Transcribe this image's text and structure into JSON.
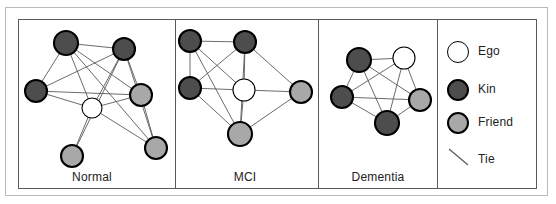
{
  "figure": {
    "type": "network-diagram-panels",
    "caption_labels": [
      "Normal",
      "MCI",
      "Dementia"
    ]
  },
  "colors": {
    "ego_fill": "#ffffff",
    "kin_fill": "#4d4d4d",
    "friend_fill": "#a8a8a8",
    "node_stroke": "#000000",
    "tie_stroke": "#5a5a5a",
    "frame_outer": "#b9b9b9",
    "frame_inner": "#5a5a5a",
    "background": "#ffffff",
    "text": "#222222"
  },
  "panels": [
    {
      "id": "normal",
      "label": "Normal",
      "label_x": 92,
      "label_y": 178,
      "nodes": [
        {
          "id": "n1",
          "type": "kin",
          "x": 66,
          "y": 43,
          "r": 12
        },
        {
          "id": "n2",
          "type": "kin",
          "x": 124,
          "y": 49,
          "r": 11
        },
        {
          "id": "n3",
          "type": "kin",
          "x": 36,
          "y": 91,
          "r": 11
        },
        {
          "id": "n4",
          "type": "friend",
          "x": 141,
          "y": 95,
          "r": 11
        },
        {
          "id": "n5",
          "type": "ego",
          "x": 92,
          "y": 108,
          "r": 10
        },
        {
          "id": "n6",
          "type": "friend",
          "x": 156,
          "y": 148,
          "r": 11
        },
        {
          "id": "n7",
          "type": "friend",
          "x": 72,
          "y": 156,
          "r": 11
        }
      ],
      "edges": [
        [
          "n1",
          "n2"
        ],
        [
          "n1",
          "n3"
        ],
        [
          "n1",
          "n4"
        ],
        [
          "n1",
          "n5"
        ],
        [
          "n1",
          "n6"
        ],
        [
          "n2",
          "n3"
        ],
        [
          "n2",
          "n4"
        ],
        [
          "n2",
          "n5"
        ],
        [
          "n2",
          "n7"
        ],
        [
          "n3",
          "n4"
        ],
        [
          "n3",
          "n5"
        ],
        [
          "n4",
          "n5"
        ],
        [
          "n4",
          "n6"
        ],
        [
          "n5",
          "n6"
        ],
        [
          "n5",
          "n7"
        ],
        [
          "n2",
          "n6"
        ]
      ]
    },
    {
      "id": "mci",
      "label": "MCI",
      "label_x": 245,
      "label_y": 178,
      "nodes": [
        {
          "id": "m1",
          "type": "kin",
          "x": 190,
          "y": 41,
          "r": 11
        },
        {
          "id": "m2",
          "type": "kin",
          "x": 245,
          "y": 42,
          "r": 11
        },
        {
          "id": "m3",
          "type": "kin",
          "x": 190,
          "y": 88,
          "r": 11
        },
        {
          "id": "m4",
          "type": "ego",
          "x": 244,
          "y": 90,
          "r": 11
        },
        {
          "id": "m5",
          "type": "friend",
          "x": 301,
          "y": 92,
          "r": 11
        },
        {
          "id": "m6",
          "type": "friend",
          "x": 240,
          "y": 134,
          "r": 12
        }
      ],
      "edges": [
        [
          "m1",
          "m2"
        ],
        [
          "m1",
          "m3"
        ],
        [
          "m1",
          "m4"
        ],
        [
          "m1",
          "m6"
        ],
        [
          "m2",
          "m3"
        ],
        [
          "m2",
          "m4"
        ],
        [
          "m2",
          "m5"
        ],
        [
          "m2",
          "m6"
        ],
        [
          "m3",
          "m4"
        ],
        [
          "m3",
          "m6"
        ],
        [
          "m4",
          "m5"
        ],
        [
          "m4",
          "m6"
        ],
        [
          "m5",
          "m6"
        ]
      ]
    },
    {
      "id": "dementia",
      "label": "Dementia",
      "label_x": 378,
      "label_y": 178,
      "nodes": [
        {
          "id": "d1",
          "type": "kin",
          "x": 359,
          "y": 60,
          "r": 12
        },
        {
          "id": "d2",
          "type": "ego",
          "x": 404,
          "y": 58,
          "r": 11
        },
        {
          "id": "d3",
          "type": "kin",
          "x": 342,
          "y": 97,
          "r": 11
        },
        {
          "id": "d4",
          "type": "friend",
          "x": 420,
          "y": 100,
          "r": 11
        },
        {
          "id": "d5",
          "type": "kin",
          "x": 387,
          "y": 123,
          "r": 12
        }
      ],
      "edges": [
        [
          "d1",
          "d2"
        ],
        [
          "d1",
          "d3"
        ],
        [
          "d1",
          "d4"
        ],
        [
          "d1",
          "d5"
        ],
        [
          "d2",
          "d3"
        ],
        [
          "d2",
          "d4"
        ],
        [
          "d2",
          "d5"
        ],
        [
          "d3",
          "d4"
        ],
        [
          "d3",
          "d5"
        ],
        [
          "d4",
          "d5"
        ]
      ]
    }
  ],
  "dividers": [
    175,
    318,
    437
  ],
  "legend": {
    "items": [
      {
        "id": "ego",
        "label": "Ego",
        "symbol": "circle",
        "fill": "#ffffff",
        "cx": 458,
        "cy": 52,
        "r": 11,
        "label_x": 478,
        "label_y": 52
      },
      {
        "id": "kin",
        "label": "Kin",
        "symbol": "circle",
        "fill": "#4d4d4d",
        "cx": 458,
        "cy": 90,
        "r": 11,
        "label_x": 478,
        "label_y": 90
      },
      {
        "id": "friend",
        "label": "Friend",
        "symbol": "circle",
        "fill": "#a8a8a8",
        "cx": 458,
        "cy": 123,
        "r": 11,
        "label_x": 478,
        "label_y": 123
      },
      {
        "id": "tie",
        "label": "Tie",
        "symbol": "line",
        "fill": "none",
        "x1": 449,
        "y1": 149,
        "x2": 468,
        "y2": 165,
        "label_x": 478,
        "label_y": 160
      }
    ]
  }
}
